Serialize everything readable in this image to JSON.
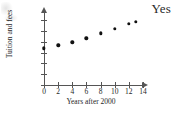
{
  "answer": {
    "text": "Yes"
  },
  "chart_data": {
    "type": "scatter",
    "title": "",
    "xlabel": "Years after 2000",
    "ylabel": "Tuition and fees",
    "x": [
      0,
      2,
      4,
      6,
      8,
      10,
      12,
      13
    ],
    "values": [
      17000,
      18500,
      19800,
      21700,
      24000,
      26000,
      28500,
      29400
    ],
    "xlim": [
      0,
      14
    ],
    "ylim": [
      0,
      32000
    ],
    "xticks": [
      0,
      2,
      4,
      6,
      8,
      10,
      12,
      14
    ],
    "xtick_labels": [
      "0",
      "2",
      "4",
      "6",
      "8",
      "10",
      "12",
      "14"
    ],
    "yticks": [
      0,
      5000,
      10000,
      15000,
      20000,
      25000,
      30000
    ],
    "ytick_labels": [
      "0",
      "5,000",
      "10,000",
      "15,000",
      "20,000",
      "25,000",
      "30,000"
    ],
    "grid": false,
    "legend": "none",
    "marker_color": "#111111",
    "axis_color": "#555555"
  }
}
